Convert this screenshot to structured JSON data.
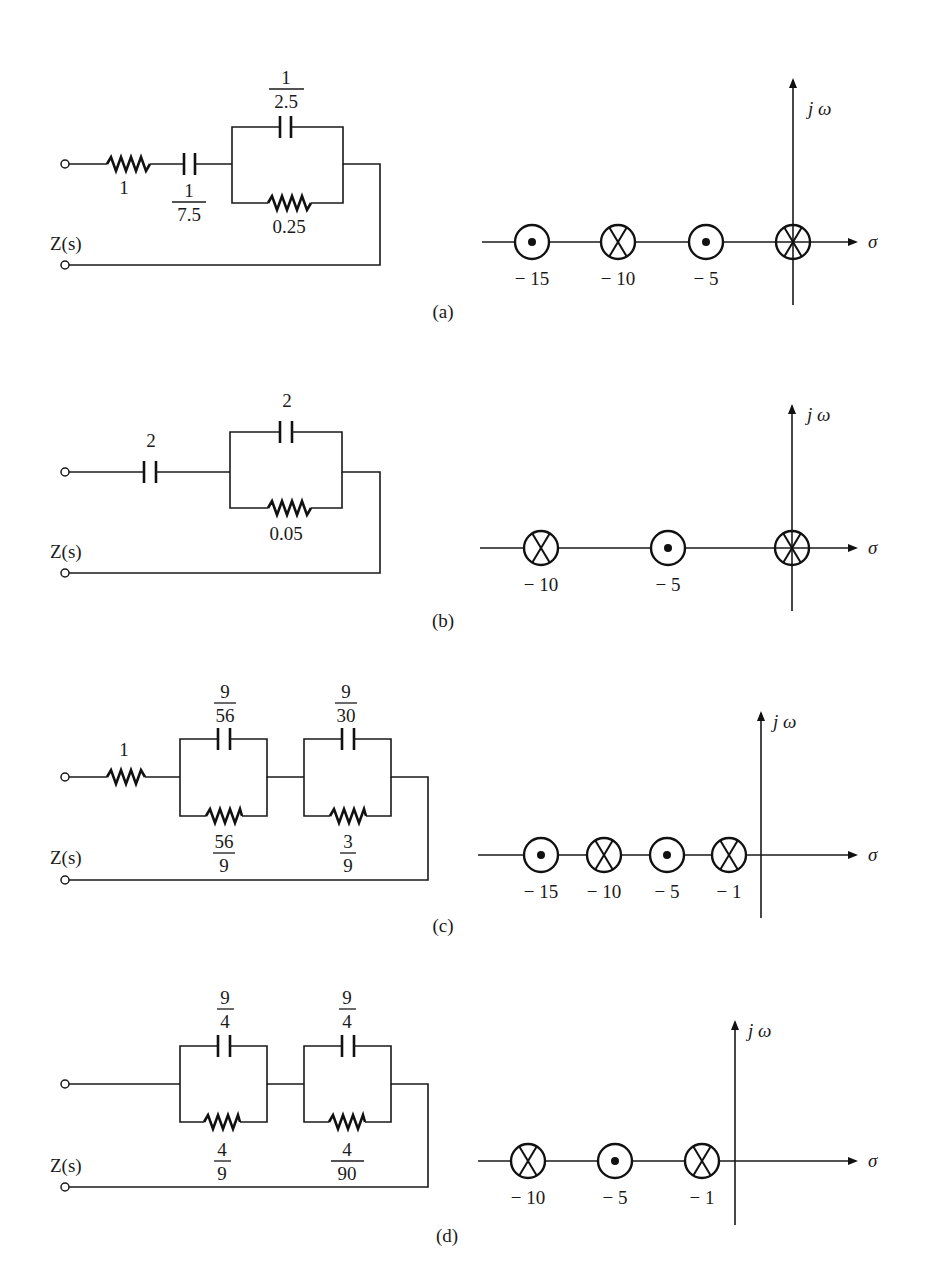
{
  "figure": {
    "parts": [
      {
        "id": "a",
        "caption": "(a)",
        "impedance_label": "Z(s)",
        "circuit": {
          "series_resistor": "1",
          "series_capacitor": {
            "num": "1",
            "den": "7.5"
          },
          "parallel_blocks": [
            {
              "capacitor": {
                "num": "1",
                "den": "2.5"
              },
              "resistor": "0.25"
            }
          ]
        },
        "pole_zero": {
          "axis_labels": {
            "imag": "j ω",
            "real": "σ"
          },
          "points": [
            {
              "value": -15,
              "label": "− 15",
              "type": "zero"
            },
            {
              "value": -10,
              "label": "− 10",
              "type": "pole"
            },
            {
              "value": -5,
              "label": "− 5",
              "type": "zero"
            },
            {
              "value": 0,
              "label": "",
              "type": "pole"
            }
          ]
        }
      },
      {
        "id": "b",
        "caption": "(b)",
        "impedance_label": "Z(s)",
        "circuit": {
          "series_capacitor": "2",
          "parallel_blocks": [
            {
              "capacitor": "2",
              "resistor": "0.05"
            }
          ]
        },
        "pole_zero": {
          "axis_labels": {
            "imag": "j ω",
            "real": "σ"
          },
          "points": [
            {
              "value": -10,
              "label": "− 10",
              "type": "pole"
            },
            {
              "value": -5,
              "label": "− 5",
              "type": "zero"
            },
            {
              "value": 0,
              "label": "",
              "type": "pole"
            }
          ]
        }
      },
      {
        "id": "c",
        "caption": "(c)",
        "impedance_label": "Z(s)",
        "circuit": {
          "series_resistor": "1",
          "parallel_blocks": [
            {
              "capacitor": {
                "num": "9",
                "den": "56"
              },
              "resistor": {
                "num": "56",
                "den": "9"
              }
            },
            {
              "capacitor": {
                "num": "9",
                "den": "30"
              },
              "resistor": {
                "num": "3",
                "den": "9"
              }
            }
          ]
        },
        "pole_zero": {
          "axis_labels": {
            "imag": "j ω",
            "real": "σ"
          },
          "points": [
            {
              "value": -15,
              "label": "− 15",
              "type": "zero"
            },
            {
              "value": -10,
              "label": "− 10",
              "type": "pole"
            },
            {
              "value": -5,
              "label": "− 5",
              "type": "zero"
            },
            {
              "value": -1,
              "label": "− 1",
              "type": "pole"
            }
          ]
        }
      },
      {
        "id": "d",
        "caption": "(d)",
        "impedance_label": "Z(s)",
        "circuit": {
          "parallel_blocks": [
            {
              "capacitor": {
                "num": "9",
                "den": "4"
              },
              "resistor": {
                "num": "4",
                "den": "9"
              }
            },
            {
              "capacitor": {
                "num": "9",
                "den": "4"
              },
              "resistor": {
                "num": "4",
                "den": "90"
              }
            }
          ]
        },
        "pole_zero": {
          "axis_labels": {
            "imag": "j ω",
            "real": "σ"
          },
          "points": [
            {
              "value": -10,
              "label": "− 10",
              "type": "pole"
            },
            {
              "value": -5,
              "label": "− 5",
              "type": "zero"
            },
            {
              "value": -1,
              "label": "− 1",
              "type": "pole"
            }
          ]
        }
      }
    ]
  }
}
